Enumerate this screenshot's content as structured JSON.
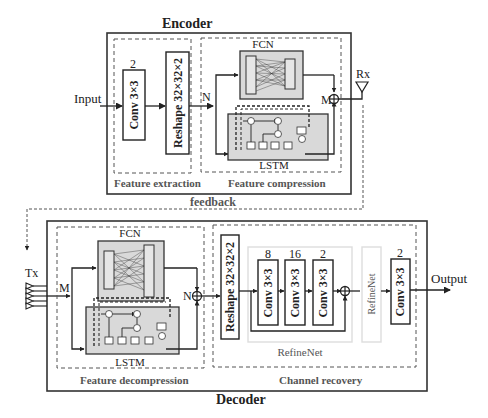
{
  "encoder": {
    "title": "Encoder",
    "input_label": "Input",
    "feature_extraction": {
      "label": "Feature extraction",
      "conv": {
        "channels": "2",
        "label": "Conv  3×3"
      },
      "reshape": {
        "label": "Reshape  32×32×2"
      }
    },
    "feature_compression": {
      "label": "Feature compression",
      "n_label": "N",
      "fcn_label": "FCN",
      "lstm_label": "LSTM",
      "m_label": "M"
    },
    "rx_label": "Rx"
  },
  "feedback_label": "feedback",
  "decoder": {
    "title": "Decoder",
    "tx_label": "Tx",
    "feature_decompression": {
      "label": "Feature decompression",
      "m_label": "M",
      "fcn_label": "FCN",
      "lstm_label": "LSTM",
      "n_label": "N"
    },
    "channel_recovery": {
      "label": "Channel recovery",
      "reshape": {
        "label": "Reshape  32×32×2"
      },
      "refinenet": {
        "label": "RefineNet",
        "convs": [
          {
            "channels": "8",
            "label": "Conv  3×3"
          },
          {
            "channels": "16",
            "label": "Conv  3×3"
          },
          {
            "channels": "2",
            "label": "Conv  3×3"
          }
        ]
      },
      "refinenet2_label": "RefineNet",
      "final_conv": {
        "channels": "2",
        "label": "Conv  3×3"
      }
    },
    "output_label": "Output"
  }
}
